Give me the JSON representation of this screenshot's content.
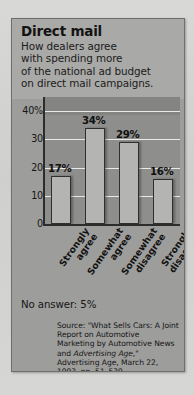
{
  "card": {
    "title": "Direct mail",
    "subtitle_lines": [
      "How dealers agree",
      "with spending more",
      "of the national ad budget",
      "on direct mail campaigns."
    ],
    "no_answer": "No answer: 5%"
  },
  "source": {
    "line1": "Source: \"What Sells Cars: A",
    "line2": "Joint Report on Automotive",
    "line3": "Marketing by Automotive",
    "line4_plain": "News",
    "line4_mid": " and ",
    "line4_italic": "Advertising Age,",
    "line4_end": "\"",
    "line5": "Advertising Age, March 22,",
    "line6": "1993, pp. 51–539."
  },
  "chart_data": {
    "type": "bar",
    "title": "Direct mail",
    "subtitle": "How dealers agree with spending more of the national ad budget on direct mail campaigns.",
    "categories": [
      "Strongly agree",
      "Somewhat agree",
      "Somewhat disagree",
      "Strongly disagree"
    ],
    "category_lines": [
      [
        "Strongly",
        "agree"
      ],
      [
        "Somewhat",
        "agree"
      ],
      [
        "Somewhat",
        "disagree"
      ],
      [
        "Strongly",
        "disagree"
      ]
    ],
    "values": [
      17,
      34,
      29,
      16
    ],
    "data_labels": [
      "17%",
      "34%",
      "29%",
      "16%"
    ],
    "xlabel": "",
    "ylabel": "",
    "ylim": [
      0,
      45
    ],
    "yticks": [
      40,
      30,
      20,
      10,
      0
    ],
    "ytick_labels": [
      "40%",
      "30",
      "20",
      "10",
      "0"
    ],
    "grid": true,
    "legend": "none",
    "annotation": "No answer: 5%",
    "colors": {
      "bar_fill": "#b4b4b2",
      "bar_outline": "#2f2f2f",
      "plot_background": "#8e8e8c",
      "card_background": "#9d9d9b",
      "header_background": "#a9a9a7",
      "gridline": "#e9e9e6",
      "text": "#131313"
    }
  }
}
